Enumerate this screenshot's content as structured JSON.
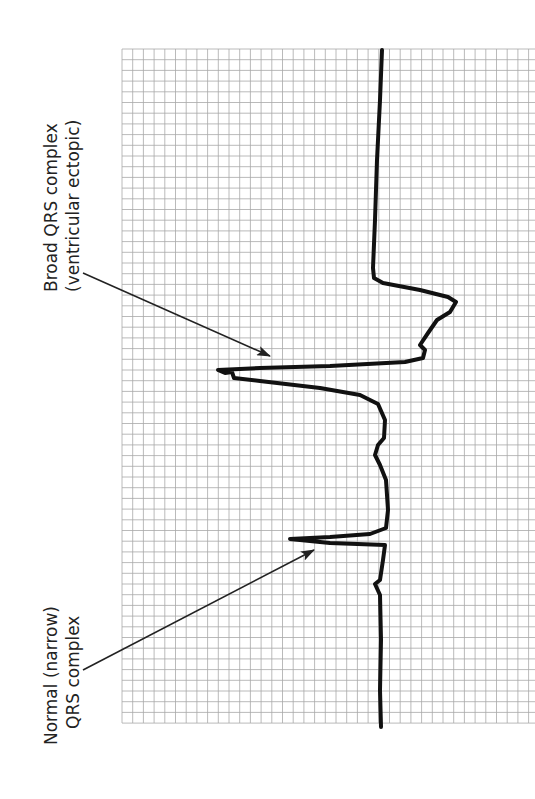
{
  "figure": {
    "colors": {
      "background": "#ffffff",
      "grid": "#a8a8a8",
      "trace": "#111111",
      "text": "#222222",
      "arrow": "#222222"
    },
    "grid": {
      "x": 122,
      "y": 49,
      "width": 413,
      "height": 674,
      "spacing": 10.7
    },
    "annotations": [
      {
        "id": "broad",
        "lines": [
          "Broad QRS complex",
          "(ventricular ectopic)"
        ],
        "arrow": {
          "from": [
            83,
            273
          ],
          "to": [
            270,
            356
          ]
        }
      },
      {
        "id": "normal",
        "lines": [
          "Normal (narrow)",
          "QRS complex"
        ],
        "arrow": {
          "from": [
            83,
            670
          ],
          "to": [
            314,
            550
          ]
        }
      }
    ]
  },
  "chart_data": {
    "type": "line",
    "xlabel": "",
    "ylabel": "",
    "grid": true,
    "annotations": [
      "Broad QRS complex (ventricular ectopic)",
      "Normal (narrow) QRS complex"
    ],
    "trace_points": [
      [
        382,
        50
      ],
      [
        380,
        100
      ],
      [
        377,
        160
      ],
      [
        375,
        220
      ],
      [
        373,
        268
      ],
      [
        374,
        278
      ],
      [
        383,
        283
      ],
      [
        420,
        290
      ],
      [
        448,
        297
      ],
      [
        456,
        302
      ],
      [
        450,
        312
      ],
      [
        437,
        320
      ],
      [
        428,
        333
      ],
      [
        420,
        345
      ],
      [
        425,
        350
      ],
      [
        423,
        358
      ],
      [
        405,
        362
      ],
      [
        330,
        366
      ],
      [
        260,
        368
      ],
      [
        218,
        370
      ],
      [
        225,
        373
      ],
      [
        232,
        372
      ],
      [
        234,
        378
      ],
      [
        260,
        381
      ],
      [
        320,
        388
      ],
      [
        360,
        395
      ],
      [
        378,
        404
      ],
      [
        385,
        420
      ],
      [
        384,
        438
      ],
      [
        378,
        445
      ],
      [
        375,
        455
      ],
      [
        380,
        465
      ],
      [
        386,
        480
      ],
      [
        388,
        510
      ],
      [
        386,
        528
      ],
      [
        370,
        534
      ],
      [
        330,
        537
      ],
      [
        290,
        539
      ],
      [
        330,
        543
      ],
      [
        385,
        545
      ],
      [
        383,
        560
      ],
      [
        380,
        580
      ],
      [
        375,
        584
      ],
      [
        380,
        595
      ],
      [
        381,
        640
      ],
      [
        380,
        690
      ],
      [
        381,
        727
      ]
    ]
  }
}
